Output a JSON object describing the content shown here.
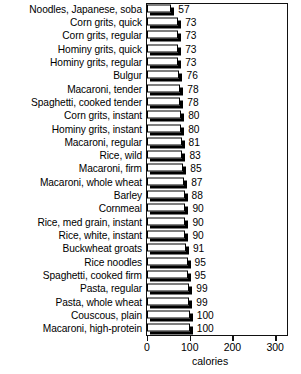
{
  "chart_data": {
    "type": "bar",
    "orientation": "horizontal",
    "title": "",
    "xlabel": "calories",
    "ylabel": "",
    "xlim": [
      0,
      300
    ],
    "xticks": [
      0,
      100,
      200,
      300
    ],
    "grid": false,
    "legend": null,
    "categories": [
      "Noodles, Japanese, soba",
      "Corn grits, quick",
      "Corn grits, regular",
      "Hominy grits, quick",
      "Hominy grits, regular",
      "Bulgur",
      "Macaroni, tender",
      "Spaghetti, cooked tender",
      "Corn grits, instant",
      "Hominy grits, instant",
      "Macaroni, regular",
      "Rice, wild",
      "Macaroni, firm",
      "Macaroni, whole wheat",
      "Barley",
      "Cornmeal",
      "Rice, med grain, instant",
      "Rice, white, instant",
      "Buckwheat groats",
      "Rice noodles",
      "Spaghetti, cooked firm",
      "Pasta, regular",
      "Pasta, whole wheat",
      "Couscous, plain",
      "Macaroni, high-protein"
    ],
    "values": [
      57,
      73,
      73,
      73,
      73,
      76,
      78,
      78,
      80,
      80,
      81,
      83,
      85,
      87,
      88,
      90,
      90,
      90,
      91,
      95,
      95,
      99,
      99,
      100,
      100
    ],
    "value_labels": [
      "57",
      "73",
      "73",
      "73",
      "73",
      "76",
      "78",
      "78",
      "80",
      "80",
      "81",
      "83",
      "85",
      "87",
      "88",
      "90",
      "90",
      "90",
      "91",
      "95",
      "95",
      "99",
      "99",
      "100",
      "100"
    ]
  },
  "axis": {
    "tick_labels": [
      "0",
      "100",
      "200",
      "300"
    ],
    "title": "calories"
  },
  "style": {
    "bar_face": "#ffffff",
    "bar_edge": "#000000",
    "bar_shadow": "#000000",
    "frame": "#111111",
    "text": "#000000",
    "background": "#ffffff"
  }
}
